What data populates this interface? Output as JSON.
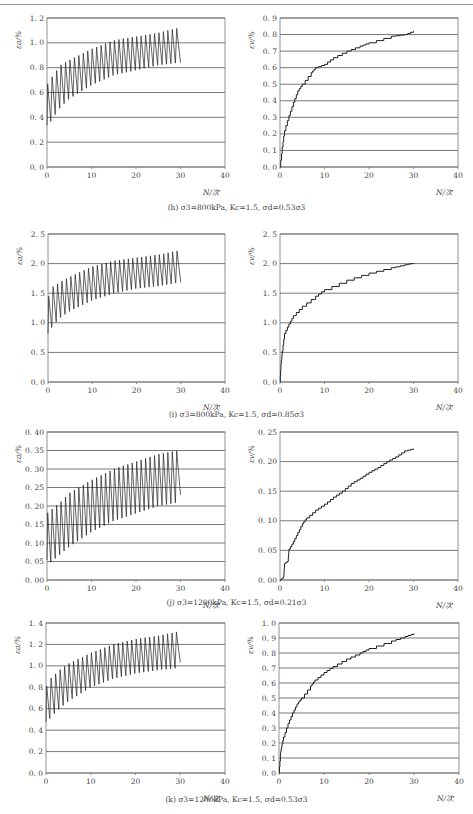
{
  "figure": {
    "captions": [
      "(h) σ3=800kPa, Kc=1.5, σd=0.53σ3",
      "(i) σ3=800kPa, Kc=1.5, σd=0.85σ3",
      "(j) σ3=1200kPa, Kc=1.5, σd=0.21σ3",
      "(k) σ3=1200kPa, Kc=1.5, σd=0.53σ3"
    ]
  },
  "chart_data": [
    {
      "id": "h-left",
      "type": "line",
      "title": "",
      "xlabel": "N/次",
      "ylabel": "εa/%",
      "xlim": [
        0,
        40
      ],
      "ylim": [
        0,
        1.2
      ],
      "xticks": [
        0,
        10,
        20,
        30,
        40
      ],
      "yticks": [
        "0.0",
        "0.2",
        "0.4",
        "0.6",
        "0.8",
        "1.0",
        "1.2"
      ],
      "grid": "horizontal",
      "cyclic": true,
      "upper_envelope": {
        "x": [
          0,
          1,
          3,
          5,
          10,
          15,
          20,
          25,
          29.5
        ],
        "y": [
          0.66,
          0.72,
          0.82,
          0.86,
          0.95,
          1.02,
          1.05,
          1.08,
          1.12
        ]
      },
      "lower_envelope": {
        "x": [
          0,
          1,
          3,
          5,
          10,
          15,
          20,
          25,
          29.5
        ],
        "y": [
          0.3,
          0.38,
          0.48,
          0.55,
          0.66,
          0.74,
          0.78,
          0.82,
          0.84
        ]
      },
      "end_value": {
        "x": 30,
        "y": 0.84
      }
    },
    {
      "id": "h-right",
      "type": "line",
      "title": "",
      "xlabel": "N/次",
      "ylabel": "εv/%",
      "xlim": [
        0,
        40
      ],
      "ylim": [
        0,
        0.9
      ],
      "xticks": [
        0,
        10,
        20,
        30,
        40
      ],
      "yticks": [
        "0.0",
        "0.1",
        "0.2",
        "0.3",
        "0.4",
        "0.5",
        "0.6",
        "0.7",
        "0.8",
        "0.9"
      ],
      "grid": "horizontal",
      "x": [
        0,
        0.5,
        1,
        2,
        3,
        4,
        5,
        7,
        8,
        10,
        12,
        15,
        18,
        20,
        25,
        28,
        30
      ],
      "y": [
        0,
        0.12,
        0.22,
        0.31,
        0.39,
        0.46,
        0.5,
        0.57,
        0.6,
        0.62,
        0.66,
        0.7,
        0.73,
        0.75,
        0.79,
        0.8,
        0.82
      ]
    },
    {
      "id": "i-left",
      "type": "line",
      "title": "",
      "xlabel": "N/次",
      "ylabel": "εa/%",
      "xlim": [
        0,
        40
      ],
      "ylim": [
        0,
        2.5
      ],
      "xticks": [
        0,
        10,
        20,
        30,
        40
      ],
      "yticks": [
        "0.0",
        "0.5",
        "1.0",
        "1.5",
        "2.0",
        "2.5"
      ],
      "grid": "horizontal",
      "cyclic": true,
      "upper_envelope": {
        "x": [
          0,
          1,
          3,
          5,
          10,
          15,
          20,
          25,
          29.5
        ],
        "y": [
          1.42,
          1.6,
          1.7,
          1.78,
          1.95,
          2.05,
          2.1,
          2.15,
          2.22
        ]
      },
      "lower_envelope": {
        "x": [
          0,
          1,
          3,
          5,
          10,
          15,
          20,
          25,
          29.5
        ],
        "y": [
          0.75,
          0.95,
          1.1,
          1.2,
          1.38,
          1.5,
          1.58,
          1.62,
          1.68
        ]
      },
      "end_value": {
        "x": 30,
        "y": 1.68
      }
    },
    {
      "id": "i-right",
      "type": "line",
      "title": "",
      "xlabel": "N/次",
      "ylabel": "εv/%",
      "xlim": [
        0,
        40
      ],
      "ylim": [
        0,
        2.5
      ],
      "xticks": [
        0,
        10,
        20,
        30,
        40
      ],
      "yticks": [
        "0.0",
        "0.5",
        "1.0",
        "1.5",
        "2.0",
        "2.5"
      ],
      "grid": "horizontal",
      "x": [
        0,
        0.2,
        0.5,
        1,
        2,
        3,
        5,
        8,
        10,
        15,
        20,
        25,
        28,
        30
      ],
      "y": [
        0,
        0.3,
        0.52,
        0.82,
        0.98,
        1.12,
        1.28,
        1.45,
        1.56,
        1.72,
        1.84,
        1.93,
        1.98,
        2.01
      ]
    },
    {
      "id": "j-left",
      "type": "line",
      "title": "",
      "xlabel": "N/次",
      "ylabel": "εa/%",
      "xlim": [
        0,
        40
      ],
      "ylim": [
        0,
        0.4
      ],
      "xticks": [
        0,
        10,
        20,
        30,
        40
      ],
      "yticks": [
        "0.00",
        "0.05",
        "0.10",
        "0.15",
        "0.20",
        "0.25",
        "0.30",
        "0.35",
        "0.40"
      ],
      "grid": "horizontal",
      "cyclic": true,
      "upper_envelope": {
        "x": [
          0,
          1,
          3,
          5,
          10,
          15,
          20,
          25,
          29.5
        ],
        "y": [
          0.18,
          0.19,
          0.21,
          0.235,
          0.27,
          0.3,
          0.32,
          0.34,
          0.35
        ]
      },
      "lower_envelope": {
        "x": [
          0,
          1,
          3,
          5,
          10,
          15,
          20,
          25,
          29.5
        ],
        "y": [
          0.04,
          0.05,
          0.07,
          0.09,
          0.13,
          0.16,
          0.18,
          0.2,
          0.21
        ]
      },
      "end_value": {
        "x": 30,
        "y": 0.23
      }
    },
    {
      "id": "j-right",
      "type": "line",
      "title": "",
      "xlabel": "N/次",
      "ylabel": "εv/%",
      "xlim": [
        0,
        40
      ],
      "ylim": [
        0,
        0.25
      ],
      "xticks": [
        0,
        10,
        20,
        30,
        40
      ],
      "yticks": [
        "0.00",
        "0.05",
        "0.10",
        "0.15",
        "0.20",
        "0.25"
      ],
      "grid": "horizontal",
      "x": [
        0,
        0.8,
        1,
        1.8,
        2,
        3,
        4,
        5,
        6,
        8,
        10,
        12,
        14,
        16,
        18,
        20,
        22,
        24,
        26,
        28,
        30
      ],
      "y": [
        0,
        0.005,
        0.028,
        0.032,
        0.052,
        0.065,
        0.08,
        0.095,
        0.105,
        0.118,
        0.128,
        0.14,
        0.15,
        0.163,
        0.172,
        0.182,
        0.19,
        0.2,
        0.208,
        0.218,
        0.222
      ]
    },
    {
      "id": "k-left",
      "type": "line",
      "title": "",
      "xlabel": "N/次",
      "ylabel": "εa/%",
      "xlim": [
        0,
        40
      ],
      "ylim": [
        0,
        1.4
      ],
      "xticks": [
        0,
        10,
        20,
        30,
        40
      ],
      "yticks": [
        "0.0",
        "0.2",
        "0.4",
        "0.6",
        "0.8",
        "1.0",
        "1.2",
        "1.4"
      ],
      "grid": "horizontal",
      "cyclic": true,
      "upper_envelope": {
        "x": [
          0,
          1,
          3,
          5,
          10,
          15,
          20,
          25,
          29.5
        ],
        "y": [
          0.8,
          0.88,
          0.96,
          1.02,
          1.12,
          1.2,
          1.25,
          1.28,
          1.32
        ]
      },
      "lower_envelope": {
        "x": [
          0,
          1,
          3,
          5,
          10,
          15,
          20,
          25,
          29.5
        ],
        "y": [
          0.44,
          0.52,
          0.6,
          0.67,
          0.8,
          0.88,
          0.93,
          0.96,
          0.98
        ]
      },
      "end_value": {
        "x": 30,
        "y": 1.03
      }
    },
    {
      "id": "k-right",
      "type": "line",
      "title": "",
      "xlabel": "N/次",
      "ylabel": "εv/%",
      "xlim": [
        0,
        40
      ],
      "ylim": [
        0,
        1.0
      ],
      "xticks": [
        0,
        10,
        20,
        30,
        40
      ],
      "yticks": [
        "0.0",
        "0.1",
        "0.2",
        "0.3",
        "0.4",
        "0.5",
        "0.6",
        "0.7",
        "0.8",
        "0.9",
        "1.0"
      ],
      "grid": "horizontal",
      "x": [
        0,
        0.3,
        0.5,
        1,
        2,
        3,
        4,
        5,
        7,
        8,
        10,
        12,
        15,
        18,
        20,
        25,
        28,
        30
      ],
      "y": [
        0,
        0.12,
        0.17,
        0.24,
        0.33,
        0.4,
        0.46,
        0.5,
        0.58,
        0.62,
        0.67,
        0.71,
        0.76,
        0.8,
        0.83,
        0.88,
        0.91,
        0.93
      ]
    }
  ]
}
